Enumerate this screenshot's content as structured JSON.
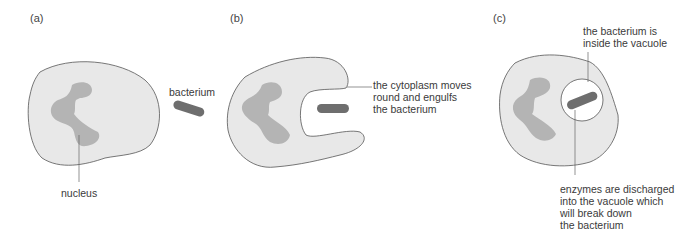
{
  "colors": {
    "cytoplasm": "#e8e8e8",
    "outline": "#555555",
    "nucleus": "#b4b4b4",
    "bacterium": "#6e6e6e",
    "vacuole": "#ffffff",
    "text": "#3a3a3a"
  },
  "panels": [
    {
      "label": "(a)",
      "annotations": {
        "bacterium": "bacterium",
        "nucleus": "nucleus"
      }
    },
    {
      "label": "(b)",
      "annotations": {
        "cytoplasm": "the cytoplasm moves\nround and engulfs\nthe bacterium"
      }
    },
    {
      "label": "(c)",
      "annotations": {
        "vacuole": "the bacterium is\ninside the vacuole",
        "enzymes": "enzymes are discharged\ninto the vacuole which\nwill break down\nthe bacterium"
      }
    }
  ]
}
